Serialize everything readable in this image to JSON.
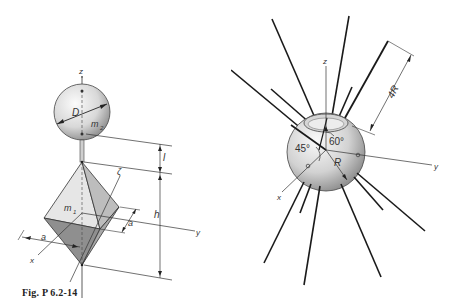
{
  "figures": [
    {
      "id": "fig-p-6-2-14",
      "caption": "Fig. P 6.2-14",
      "labels": {
        "z_axis": "z",
        "y_axis": "y",
        "x_axis": "x",
        "zeta_axis": "ζ",
        "sphere_diameter": "D",
        "sphere_mass": "m",
        "sphere_mass_sub": "2",
        "bipyramid_mass": "m",
        "bipyramid_mass_sub": "1",
        "rod_length": "l",
        "height": "h",
        "side_x": "a",
        "side_y": "a"
      },
      "description": "Sphere of diameter D and mass m2 mounted on a rod of length l above a square bipyramid (octahedron) of mass m1, height h, base side a, with axes x, y, z and ζ."
    },
    {
      "id": "fig-p-6-2-15",
      "caption": "Fig. P 6.2-15",
      "labels": {
        "z_axis": "z",
        "y_axis": "y",
        "x_axis": "x",
        "radius": "R",
        "rod_length": "4R",
        "angle_1": "45°",
        "angle_2": "60°"
      },
      "description": "Sphere of radius R with a cut top and multiple rods of length 4R radiating from it; angles 45° and 60° indicated."
    }
  ],
  "colors": {
    "line": "#1a1a1a",
    "sphere_light": "#f2f2f2",
    "sphere_dark": "#8a8a8a",
    "face_light": "#e4e4e4",
    "face_mid": "#bdbdbd",
    "face_dark": "#8f8f8f"
  }
}
